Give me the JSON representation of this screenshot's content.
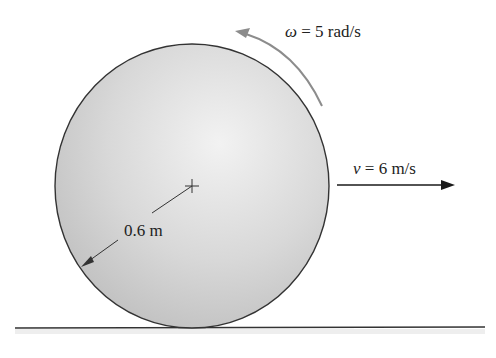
{
  "diagram": {
    "type": "rolling-disk",
    "angular_velocity": {
      "symbol": "ω",
      "equals": " = ",
      "value": "5 rad/s",
      "direction": "counterclockwise"
    },
    "linear_velocity": {
      "symbol": "v",
      "equals": " = ",
      "value": "6 m/s",
      "direction": "right"
    },
    "radius": {
      "label": "0.6 m"
    },
    "colors": {
      "disk_fill": "#d9d9d9",
      "disk_edge": "#333333",
      "omega_arrow": "#8c8c8c",
      "velocity_arrow": "#1a1a1a",
      "ground": "#333333"
    }
  }
}
